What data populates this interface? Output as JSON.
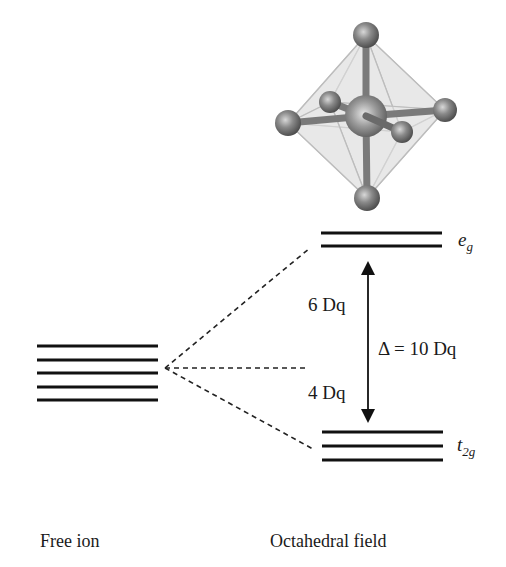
{
  "diagram": {
    "free_ion": {
      "label": "Free ion",
      "level_count": 5
    },
    "octahedral_field": {
      "label": "Octahedral field",
      "upper_set": {
        "label_main": "e",
        "label_sub": "g",
        "level_count": 2
      },
      "lower_set": {
        "label_main": "t",
        "label_sub": "2g",
        "level_count": 3
      }
    },
    "annotations": {
      "upper_shift": "6 Dq",
      "lower_shift": "4 Dq",
      "splitting": "Δ = 10 Dq"
    },
    "illustration": {
      "name": "octahedral complex ball-and-stick model",
      "ligand_count": 6
    },
    "colors": {
      "line": "#111111",
      "ball": "#6f6f6f",
      "octahedron_face": "#d9d9d9"
    }
  }
}
